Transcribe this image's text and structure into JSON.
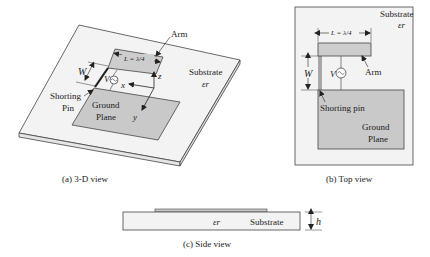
{
  "diagram": {
    "views": {
      "three_d": {
        "caption": "(a) 3-D view",
        "labels": {
          "arm": "Arm",
          "length": "L = λ/4",
          "width": "W",
          "source": "V",
          "axis_z": "z",
          "axis_x": "x",
          "axis_y": "y",
          "substrate": "Substrate",
          "permittivity": "εr",
          "shorting_line1": "Shorting",
          "shorting_line2": "Pin",
          "ground_line1": "Ground",
          "ground_line2": "Plane"
        }
      },
      "top": {
        "caption": "(b) Top view",
        "labels": {
          "substrate": "Substrate",
          "permittivity": "εr",
          "length": "L = λ/4",
          "width": "W",
          "source": "V",
          "arm": "Arm",
          "shorting": "Shorting pin",
          "ground_line1": "Ground",
          "ground_line2": "Plane"
        }
      },
      "side": {
        "caption": "(c) Side view",
        "labels": {
          "permittivity": "εr",
          "substrate": "Substrate",
          "height": "h"
        }
      }
    },
    "colors": {
      "substrate": "#f2f2f2",
      "metal": "#c8c8c8",
      "line": "#333333"
    }
  }
}
